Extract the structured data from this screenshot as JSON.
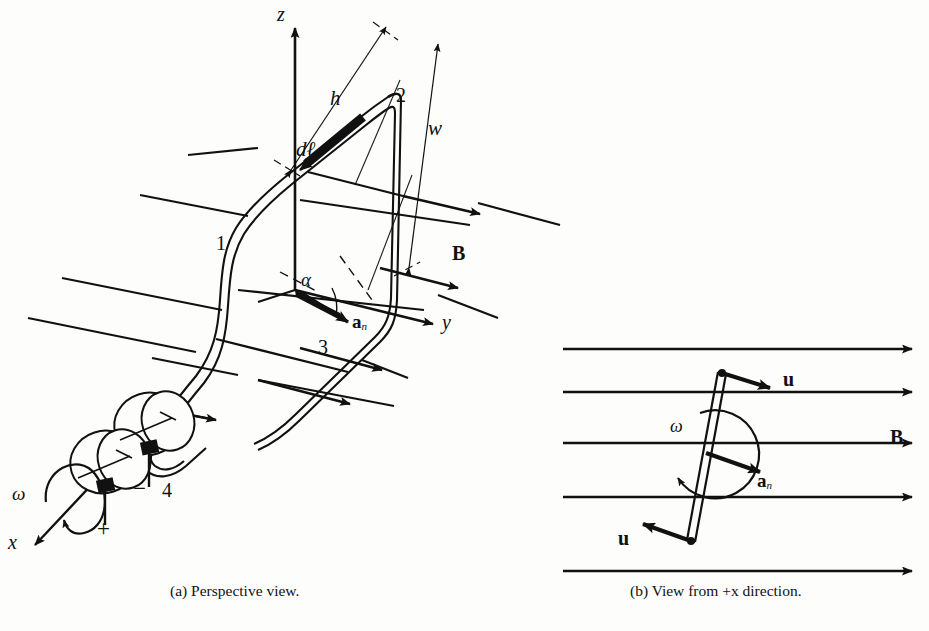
{
  "figure": {
    "ink_color": "#111111",
    "background": "#fdfdfb"
  },
  "panel_a": {
    "caption": "(a) Perspective view.",
    "axes": {
      "z": "z",
      "y": "y",
      "x": "x"
    },
    "dimensions": {
      "height": "h",
      "width": "w"
    },
    "vectors": {
      "differential_length": "dℓ",
      "normal_bold": "a",
      "normal_sub": "n",
      "field": "B",
      "angular_velocity": "ω"
    },
    "angle": "α",
    "corner_labels": [
      "1",
      "2",
      "3",
      "4"
    ],
    "terminals": {
      "positive": "+",
      "negative": "−"
    },
    "field_line_count": 6
  },
  "panel_b": {
    "caption": "(b) View from +x direction.",
    "vectors": {
      "velocity_top": "u",
      "velocity_bottom": "u",
      "normal_bold": "a",
      "normal_sub": "n",
      "field": "B",
      "angular_velocity": "ω"
    },
    "field_line_count": 5
  }
}
